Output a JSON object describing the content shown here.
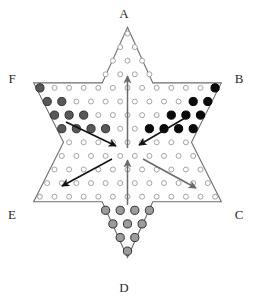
{
  "figure": {
    "kind": "chinese-checkers-board",
    "background_color": "#ffffff",
    "outline_color": "#6e6e6e",
    "hole_outline_color": "#9a9a9a",
    "hole_fill_color": "#ffffff"
  },
  "vertex_labels": [
    {
      "id": "A",
      "text": "A",
      "position": "top",
      "x": 124,
      "y": 18
    },
    {
      "id": "B",
      "text": "B",
      "position": "upper-right",
      "x": 239,
      "y": 83
    },
    {
      "id": "C",
      "text": "C",
      "position": "lower-right",
      "x": 239,
      "y": 219
    },
    {
      "id": "D",
      "text": "D",
      "position": "bottom",
      "x": 124,
      "y": 292
    },
    {
      "id": "E",
      "text": "E",
      "position": "lower-left",
      "x": 12,
      "y": 219
    },
    {
      "id": "F",
      "text": "F",
      "position": "upper-left",
      "x": 12,
      "y": 83
    }
  ],
  "pegs": {
    "corner_F": {
      "label": "F",
      "color": "#585858",
      "ring": "#2f2f2f",
      "count": 15,
      "state": "occupied"
    },
    "corner_B": {
      "label": "B",
      "color": "#0a0a0a",
      "ring": "#000000",
      "count": 15,
      "state": "occupied"
    },
    "corner_D": {
      "label": "D",
      "color": "#9c9c9c",
      "ring": "#2f2f2f",
      "count": 15,
      "state": "occupied"
    },
    "corner_A": {
      "label": "A",
      "color": "#ffffff",
      "ring": "#9a9a9a",
      "count": 15,
      "state": "empty"
    },
    "corner_C": {
      "label": "C",
      "color": "#ffffff",
      "ring": "#9a9a9a",
      "count": 15,
      "state": "empty"
    },
    "corner_E": {
      "label": "E",
      "color": "#ffffff",
      "ring": "#9a9a9a",
      "count": 15,
      "state": "empty"
    },
    "center": {
      "label": "center",
      "color": "#ffffff",
      "ring": "#9a9a9a",
      "count": 61,
      "state": "empty"
    }
  },
  "arrows": [
    {
      "id": "arrow-up-north",
      "color": "#6a6a6a",
      "from": "below-center",
      "to": "A",
      "direction": "up"
    },
    {
      "id": "arrow-F-to-center",
      "color": "#111111",
      "from": "F",
      "to": "center",
      "direction": "down-right"
    },
    {
      "id": "arrow-B-to-center",
      "color": "#111111",
      "from": "B",
      "to": "center",
      "direction": "down-left"
    },
    {
      "id": "arrow-center-to-E",
      "color": "#111111",
      "from": "center",
      "to": "E",
      "direction": "down-left"
    },
    {
      "id": "arrow-center-to-C",
      "color": "#6a6a6a",
      "from": "center",
      "to": "C",
      "direction": "down-right"
    },
    {
      "id": "arrow-up-south",
      "color": "#6a6a6a",
      "from": "D",
      "to": "center",
      "direction": "up"
    }
  ],
  "geometry": {
    "rows_top_to_bottom": [
      1,
      2,
      3,
      4,
      13,
      12,
      11,
      10,
      9,
      10,
      11,
      12,
      13,
      4,
      3,
      2,
      1
    ],
    "total_holes": 121,
    "col_spacing": 14.6,
    "row_spacing": 13.6,
    "origin_x": 127.5,
    "origin_y": 33.5
  }
}
